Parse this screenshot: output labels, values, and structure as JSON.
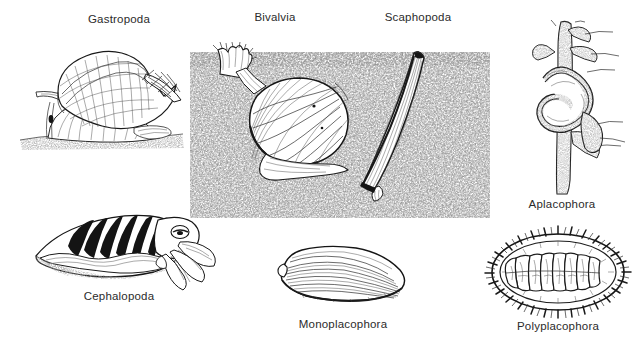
{
  "figure": {
    "width": 641,
    "height": 344,
    "background_color": "#ffffff",
    "ink_color": "#1a1a1a",
    "label_color": "#2b2b2b"
  },
  "substrate": {
    "name": "stippled-sand-block",
    "description": "rectangular stippled sediment field behind Bivalvia and Scaphopoda",
    "x": 190,
    "y": 47,
    "width": 300,
    "height": 171,
    "stipple_color": "#555555"
  },
  "labels": {
    "gastropoda": "Gastropoda",
    "bivalvia": "Bivalvia",
    "scaphopoda": "Scaphopoda",
    "aplacophora": "Aplacophora",
    "cephalopoda": "Cephalopoda",
    "monoplacophora": "Monoplacophora",
    "polyplacophora": "Polyplacophora"
  },
  "organisms": [
    {
      "id": "gastropoda",
      "label": "Gastropoda",
      "common": "snail",
      "label_x": 119,
      "label_y": 22,
      "panel_x": 14,
      "panel_y": 40,
      "panel_w": 180,
      "panel_h": 115
    },
    {
      "id": "bivalvia",
      "label": "Bivalvia",
      "common": "clam / scallop in sediment",
      "label_x": 275,
      "label_y": 20,
      "panel_x": 196,
      "panel_y": 42,
      "panel_w": 170,
      "panel_h": 140
    },
    {
      "id": "scaphopoda",
      "label": "Scaphopoda",
      "common": "tusk shell in sediment",
      "label_x": 418,
      "label_y": 20,
      "panel_x": 352,
      "panel_y": 46,
      "panel_w": 85,
      "panel_h": 155
    },
    {
      "id": "aplacophora",
      "label": "Aplacophora",
      "common": "solenogaster on hydroid stem",
      "label_x": 562,
      "label_y": 207,
      "panel_x": 523,
      "panel_y": 20,
      "panel_w": 110,
      "panel_h": 175
    },
    {
      "id": "cephalopoda",
      "label": "Cephalopoda",
      "common": "cuttlefish",
      "label_x": 119,
      "label_y": 299,
      "panel_x": 28,
      "panel_y": 208,
      "panel_w": 190,
      "panel_h": 82
    },
    {
      "id": "monoplacophora",
      "label": "Monoplacophora",
      "common": "Neopilina shell",
      "label_x": 343,
      "label_y": 328,
      "panel_x": 272,
      "panel_y": 240,
      "panel_w": 140,
      "panel_h": 72
    },
    {
      "id": "polyplacophora",
      "label": "Polyplacophora",
      "common": "chiton, eight dorsal plates",
      "label_x": 558,
      "label_y": 330,
      "panel_x": 480,
      "panel_y": 228,
      "panel_w": 155,
      "panel_h": 90,
      "plate_count": 8
    }
  ]
}
